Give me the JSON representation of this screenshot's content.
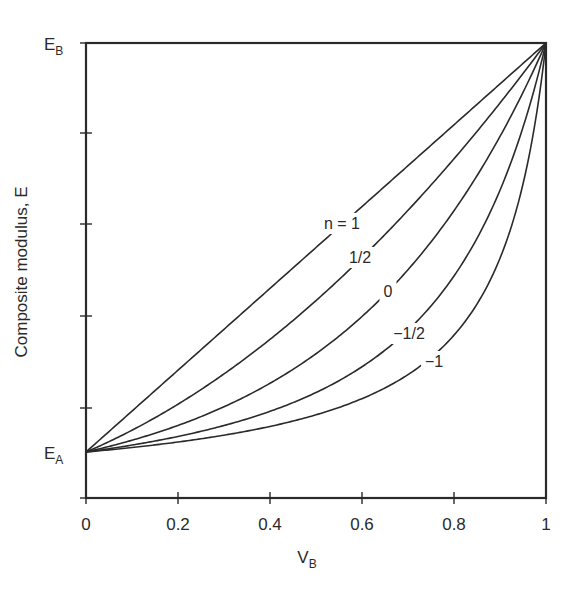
{
  "chart_data": {
    "type": "line",
    "title": "",
    "xlabel": "V_B",
    "xlabel_main": "V",
    "xlabel_sub": "B",
    "ylabel": "Composite modulus, E",
    "xlim": [
      0,
      1
    ],
    "ylim_labels": {
      "bottom": "E_A",
      "top": "E_B"
    },
    "ylim_label_parts": {
      "bottom": {
        "main": "E",
        "sub": "A"
      },
      "top": {
        "main": "E",
        "sub": "B"
      }
    },
    "x_ticks": [
      0,
      0.2,
      0.4,
      0.6,
      0.8,
      1
    ],
    "x_tick_labels": [
      "0",
      "0.2",
      "0.4",
      "0.6",
      "0.8",
      "1"
    ],
    "y_minor_ticks_count": 4,
    "grid": false,
    "legend": "inline curve labels",
    "model": "E^n = (1 - V_B) E_A^n + V_B E_B^n",
    "E_A_relative": 1,
    "E_B_relative": 10,
    "series": [
      {
        "name": "n = 1",
        "n": 1,
        "label": "n = 1",
        "x": [
          0,
          0.2,
          0.4,
          0.5,
          0.6,
          0.8,
          1
        ],
        "y_normalized": [
          0,
          0.2,
          0.4,
          0.5,
          0.6,
          0.8,
          1
        ]
      },
      {
        "name": "1/2",
        "n": 0.5,
        "label": "1/2",
        "x": [
          0,
          0.2,
          0.4,
          0.5,
          0.6,
          0.8,
          1
        ],
        "y_normalized": [
          0,
          0.11,
          0.27,
          0.37,
          0.47,
          0.71,
          1
        ]
      },
      {
        "name": "0",
        "n": 0,
        "label": "0",
        "x": [
          0,
          0.2,
          0.4,
          0.5,
          0.6,
          0.8,
          1
        ],
        "y_normalized": [
          0,
          0.06,
          0.17,
          0.24,
          0.33,
          0.58,
          1
        ]
      },
      {
        "name": "-1/2",
        "n": -0.5,
        "label": "−1/2",
        "x": [
          0,
          0.2,
          0.4,
          0.5,
          0.6,
          0.8,
          1
        ],
        "y_normalized": [
          0,
          0.03,
          0.09,
          0.14,
          0.21,
          0.43,
          1
        ]
      },
      {
        "name": "-1",
        "n": -1,
        "label": "−1",
        "x": [
          0,
          0.2,
          0.4,
          0.5,
          0.6,
          0.8,
          1
        ],
        "y_normalized": [
          0,
          0.02,
          0.06,
          0.09,
          0.13,
          0.28,
          1
        ]
      }
    ],
    "label_positions": [
      {
        "x": 342,
        "y": 229
      },
      {
        "x": 360,
        "y": 263
      },
      {
        "x": 388,
        "y": 297
      },
      {
        "x": 409,
        "y": 339
      },
      {
        "x": 434,
        "y": 367
      }
    ]
  }
}
